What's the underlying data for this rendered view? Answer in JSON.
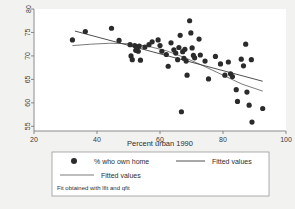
{
  "chart_data": {
    "type": "scatter",
    "title": "",
    "subtitle": "Fit obtained with lfit and qfit",
    "xlabel": "Percent urban 1990",
    "ylabel": "",
    "xlim": [
      20,
      100
    ],
    "ylim": [
      54,
      80
    ],
    "xticks": [
      20,
      40,
      60,
      80,
      100
    ],
    "yticks": [
      55,
      60,
      65,
      70,
      75,
      80
    ],
    "xtick_labels": [
      "20",
      "40",
      "60",
      "80",
      "100"
    ],
    "ytick_labels": [
      "55",
      "60",
      "65",
      "70",
      "75",
      "80"
    ],
    "grid": false,
    "legend_position": "below-plot",
    "marker_color": "#2b2b2b",
    "linear_fit_color": "#3c3c3c",
    "quadratic_fit_color": "#6b6b6b",
    "plot_background": "#ffffff",
    "figure_background": "#f2f2f0",
    "series": [
      {
        "name": "% who own home",
        "type": "scatter",
        "points": [
          [
            32.2,
            73.4
          ],
          [
            36.3,
            75.2
          ],
          [
            44.6,
            75.9
          ],
          [
            47.0,
            73.3
          ],
          [
            50.5,
            72.4
          ],
          [
            50.8,
            70.0
          ],
          [
            51.2,
            69.2
          ],
          [
            52.0,
            72.2
          ],
          [
            52.3,
            71.2
          ],
          [
            52.6,
            71.6
          ],
          [
            53.1,
            71.0
          ],
          [
            53.4,
            72.1
          ],
          [
            53.8,
            69.1
          ],
          [
            55.2,
            71.9
          ],
          [
            56.5,
            72.4
          ],
          [
            57.5,
            73.0
          ],
          [
            59.4,
            73.4
          ],
          [
            60.0,
            72.2
          ],
          [
            60.6,
            71.0
          ],
          [
            62.0,
            70.3
          ],
          [
            62.6,
            67.8
          ],
          [
            63.5,
            72.8
          ],
          [
            64.4,
            71.3
          ],
          [
            65.0,
            70.6
          ],
          [
            65.6,
            69.2
          ],
          [
            66.0,
            71.8
          ],
          [
            66.4,
            74.4
          ],
          [
            66.8,
            58.1
          ],
          [
            67.2,
            70.9
          ],
          [
            67.6,
            69.5
          ],
          [
            67.9,
            71.4
          ],
          [
            68.3,
            68.9
          ],
          [
            68.6,
            65.9
          ],
          [
            69.4,
            77.5
          ],
          [
            69.8,
            74.9
          ],
          [
            70.2,
            71.7
          ],
          [
            70.6,
            70.1
          ],
          [
            71.0,
            69.6
          ],
          [
            72.4,
            73.6
          ],
          [
            72.8,
            70.2
          ],
          [
            74.3,
            68.9
          ],
          [
            75.4,
            65.1
          ],
          [
            77.6,
            69.9
          ],
          [
            79.2,
            68.3
          ],
          [
            80.6,
            65.9
          ],
          [
            81.7,
            68.7
          ],
          [
            82.4,
            66.2
          ],
          [
            83.0,
            65.6
          ],
          [
            84.2,
            62.8
          ],
          [
            84.6,
            60.3
          ],
          [
            85.8,
            69.3
          ],
          [
            86.5,
            67.9
          ],
          [
            87.2,
            72.5
          ],
          [
            87.6,
            62.3
          ],
          [
            88.3,
            59.5
          ],
          [
            89.0,
            69.2
          ],
          [
            89.2,
            55.9
          ],
          [
            92.6,
            58.8
          ]
        ]
      },
      {
        "name": "Fitted values",
        "type": "line",
        "fit": "linear",
        "points": [
          [
            33.0,
            75.3
          ],
          [
            92.6,
            64.6
          ]
        ]
      },
      {
        "name": "Fitted values",
        "type": "line",
        "fit": "quadratic",
        "points": [
          [
            32.2,
            72.2
          ],
          [
            38.0,
            72.5
          ],
          [
            44.0,
            72.7
          ],
          [
            50.0,
            72.6
          ],
          [
            56.0,
            72.1
          ],
          [
            62.0,
            71.1
          ],
          [
            68.0,
            69.6
          ],
          [
            74.0,
            67.8
          ],
          [
            80.0,
            65.9
          ],
          [
            86.0,
            64.0
          ],
          [
            92.6,
            62.5
          ]
        ]
      }
    ],
    "legend_entries": [
      {
        "label": "% who own home",
        "key": "marker"
      },
      {
        "label": "Fitted values",
        "key": "line-linear"
      },
      {
        "label": "Fitted values",
        "key": "line-quadratic"
      }
    ]
  }
}
